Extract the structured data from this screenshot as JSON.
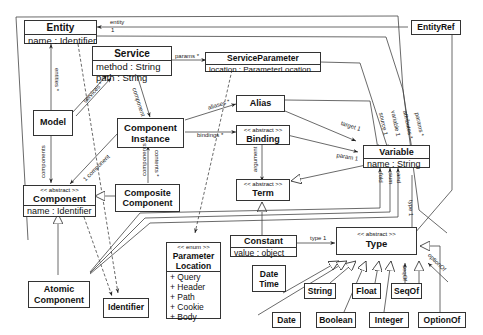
{
  "diagram": {
    "classes": {
      "entity": {
        "name": "Entity",
        "attrs": [
          "name : Identifier"
        ]
      },
      "service": {
        "name": "Service",
        "attrs": [
          "method : String",
          "path : String"
        ]
      },
      "service_parameter": {
        "name": "ServiceParameter",
        "attrs": [
          "location : ParameterLocation"
        ]
      },
      "entity_ref": {
        "name": "EntityRef"
      },
      "model": {
        "name": "Model"
      },
      "component_instance": {
        "name": "Component Instance"
      },
      "alias": {
        "name": "Alias"
      },
      "binding": {
        "stereotype": "<< abstract >>",
        "name": "Binding"
      },
      "variable": {
        "name": "Variable",
        "attrs": [
          "name : String"
        ]
      },
      "component": {
        "stereotype": "<< abstract >>",
        "name": "Component",
        "attrs": [
          "name : Identifier"
        ]
      },
      "composite_component": {
        "name": "Composite Component"
      },
      "term": {
        "stereotype": "<< abstract >>",
        "name": "Term"
      },
      "constant": {
        "name": "Constant",
        "attrs": [
          "value : object"
        ]
      },
      "parameter_location": {
        "stereotype": "<< enum >>",
        "name": "Parameter Location",
        "attrs": [
          "+ Query",
          "+ Header",
          "+ Path",
          "+ Cookie",
          "+ Body"
        ]
      },
      "type": {
        "stereotype": "<< abstract >>",
        "name": "Type"
      },
      "atomic_component": {
        "name": "Atomic Component"
      },
      "identifier": {
        "name": "Identifier"
      },
      "date_time": {
        "name": "Date Time"
      },
      "string": {
        "name": "String"
      },
      "float": {
        "name": "Float"
      },
      "seq_of": {
        "name": "SeqOf"
      },
      "date": {
        "name": "Date"
      },
      "boolean": {
        "name": "Boolean"
      },
      "integer": {
        "name": "Integer"
      },
      "option_of": {
        "name": "OptionOf"
      }
    },
    "edge_labels": {
      "entity": "entity",
      "entity_mult": "1",
      "params": "params *",
      "entities": "entities *",
      "components_model": "components",
      "services": "services *",
      "component_svc": "component",
      "aliases": "aliases *",
      "bindings": "bindings *",
      "components_ci": "1 component",
      "components_composite": "components",
      "contents": "contents *",
      "argument": "argument",
      "target": "target 1",
      "param": "param 1",
      "source": "source 1",
      "variable": "variable 1",
      "attributes": "attributes *",
      "params_var": "params *",
      "fold": "fold",
      "sum": "sum",
      "and": "and",
      "type_var": "type 1",
      "type_const": "type 1",
      "seq_of": "seqOf",
      "option_of": "optionOf"
    }
  }
}
